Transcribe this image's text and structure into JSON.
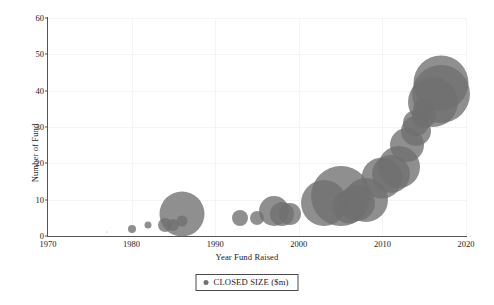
{
  "chart_data": {
    "type": "scatter",
    "subtype": "bubble",
    "title": "",
    "xlabel": "Year Fund Raised",
    "ylabel": "Number of Fund",
    "xlim": [
      1970,
      2020
    ],
    "ylim": [
      0,
      60
    ],
    "xticks": [
      "1970",
      "1980",
      "1990",
      "2000",
      "2010",
      "2020"
    ],
    "yticks": [
      "0",
      "10",
      "20",
      "30",
      "40",
      "50",
      "60"
    ],
    "grid": true,
    "legend_position": "bottom-center",
    "series": [
      {
        "name": "CLOSED SIZE ($m)",
        "color": "#6f6f6f",
        "opacity": 0.78,
        "points": [
          {
            "x": 1977,
            "y": 1,
            "size": 1
          },
          {
            "x": 1980,
            "y": 2,
            "size": 8
          },
          {
            "x": 1982,
            "y": 3,
            "size": 7
          },
          {
            "x": 1984,
            "y": 3,
            "size": 14
          },
          {
            "x": 1985,
            "y": 3,
            "size": 12
          },
          {
            "x": 1986,
            "y": 4,
            "size": 11
          },
          {
            "x": 1986,
            "y": 6,
            "size": 45
          },
          {
            "x": 1993,
            "y": 5,
            "size": 16
          },
          {
            "x": 1995,
            "y": 5,
            "size": 14
          },
          {
            "x": 1997,
            "y": 7,
            "size": 30
          },
          {
            "x": 1998,
            "y": 6,
            "size": 24
          },
          {
            "x": 1999,
            "y": 6,
            "size": 22
          },
          {
            "x": 2003,
            "y": 9,
            "size": 46
          },
          {
            "x": 2005,
            "y": 11,
            "size": 60
          },
          {
            "x": 2006,
            "y": 8,
            "size": 33
          },
          {
            "x": 2007,
            "y": 9,
            "size": 36
          },
          {
            "x": 2008,
            "y": 10,
            "size": 44
          },
          {
            "x": 2010,
            "y": 16,
            "size": 41
          },
          {
            "x": 2011,
            "y": 17,
            "size": 38
          },
          {
            "x": 2012,
            "y": 19,
            "size": 42
          },
          {
            "x": 2013,
            "y": 25,
            "size": 34
          },
          {
            "x": 2014,
            "y": 29,
            "size": 30
          },
          {
            "x": 2014,
            "y": 31,
            "size": 26
          },
          {
            "x": 2015,
            "y": 33,
            "size": 24
          },
          {
            "x": 2015,
            "y": 35,
            "size": 22
          },
          {
            "x": 2016,
            "y": 37,
            "size": 50
          },
          {
            "x": 2017,
            "y": 42,
            "size": 55
          },
          {
            "x": 2017,
            "y": 39,
            "size": 58
          }
        ]
      }
    ]
  },
  "legend": {
    "entries": [
      {
        "label": "CLOSED SIZE ($m)",
        "marker": "circle-marker-icon",
        "color": "#6f6f6f"
      }
    ]
  },
  "axes": {
    "y_title": "Number of Fund",
    "x_title": "Year Fund Raised"
  }
}
